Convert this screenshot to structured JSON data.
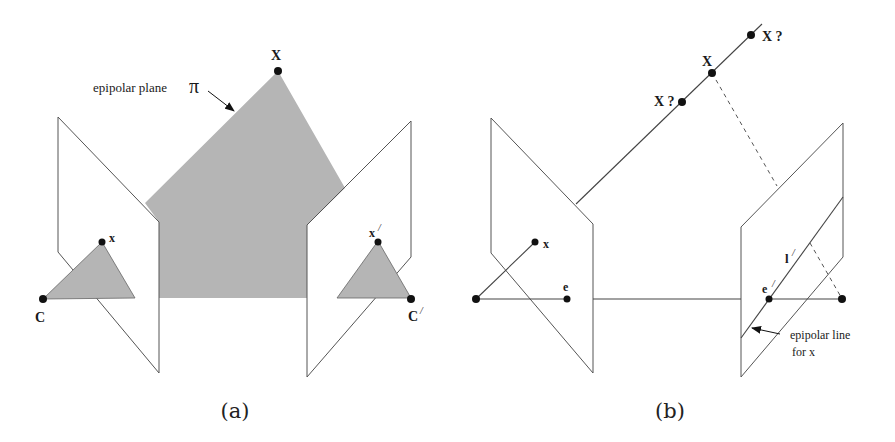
{
  "figure": {
    "colors": {
      "plane_fill": "#b5b5b5",
      "line": "#555555",
      "point": "#111111",
      "background": "#ffffff"
    },
    "panel_a": {
      "caption": "(a)",
      "epipolar_plane_label": "epipolar plane",
      "pi_symbol": "π",
      "world_point_label": "X",
      "left_image_point_label": "x",
      "right_image_point_label": "x",
      "right_image_point_prime": "/",
      "left_camera_label": "C",
      "right_camera_label": "C",
      "right_camera_prime": "/"
    },
    "panel_b": {
      "caption": "(b)",
      "world_point_label": "X",
      "candidate_point_labels": [
        "X ?",
        "X ?"
      ],
      "left_image_point_label": "x",
      "left_epipole_label": "e",
      "right_epipole_label": "e",
      "right_epipole_prime": "/",
      "epipolar_line_label": "l",
      "epipolar_line_prime": "/",
      "annotation_line1": "epipolar line",
      "annotation_line2": "for x"
    }
  }
}
